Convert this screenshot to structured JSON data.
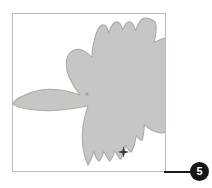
{
  "figure": {
    "frame": {
      "border_color": "#bcbcbc",
      "background_color": "#ffffff"
    },
    "silhouette": {
      "name": "raptor-in-flight-silhouette",
      "fill_color": "#c6c7c3",
      "stroke_color": "#a9aaa6",
      "description": "Hawk seen from below in flight, head to the left, fanned tail to the right"
    },
    "markers": [
      {
        "name": "center-dot-marker",
        "label": "",
        "color": "#9a9a96",
        "x": 87,
        "y": 94
      },
      {
        "name": "star-marker",
        "label": "",
        "color": "#3a3a3a",
        "x": 124,
        "y": 153
      }
    ]
  },
  "callout": {
    "number": "5",
    "badge_color": "#15161a",
    "text_color": "#ffffff",
    "leader_color": "#1a1a1a"
  }
}
